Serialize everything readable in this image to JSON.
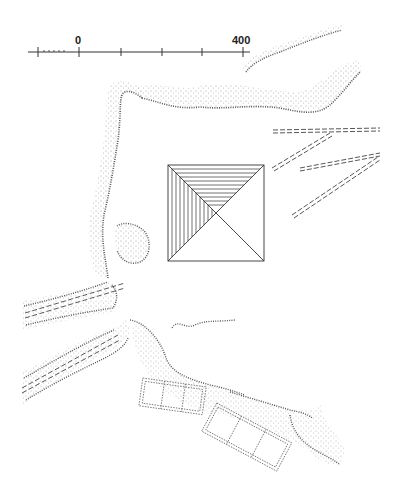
{
  "diagram": {
    "type": "archaeological site plan",
    "scale_bar": {
      "labels": [
        "0",
        "400"
      ],
      "ticks": 5,
      "subdivided_left_segment": true
    },
    "features": [
      {
        "name": "pyramid",
        "shape": "square with diagonals, NW quadrant hatched"
      },
      {
        "name": "escarpment-north",
        "style": "stippled ridge with hachures"
      },
      {
        "name": "escarpment-west",
        "style": "stippled ridge with hachures"
      },
      {
        "name": "escarpment-south",
        "style": "stippled ridge with hachures"
      },
      {
        "name": "knoll",
        "style": "stippled circular mound"
      },
      {
        "name": "causeways-east",
        "style": "dashed double lines",
        "count": 4
      },
      {
        "name": "causeways-west",
        "style": "dashed double lines in wadi",
        "count": 2
      },
      {
        "name": "enclosures-south",
        "style": "dotted rectangular compartments",
        "count": 2,
        "cells_each": 3
      }
    ],
    "colors": {
      "ink": "#333333",
      "stipple": "#9a9a9a",
      "background": "#ffffff"
    }
  },
  "scale": {
    "zero_label": "0",
    "max_label": "400"
  }
}
